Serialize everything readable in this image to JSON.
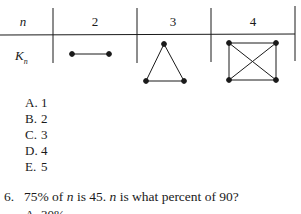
{
  "table": {
    "header_label": "n",
    "row_label": "K",
    "row_label_sub": "n",
    "columns": [
      "2",
      "3",
      "4"
    ],
    "graphs": [
      {
        "n": 2,
        "name": "K2",
        "shape": "line-segment"
      },
      {
        "n": 3,
        "name": "K3",
        "shape": "triangle"
      },
      {
        "n": 4,
        "name": "K4",
        "shape": "square-with-diagonals"
      }
    ]
  },
  "question5_options": [
    {
      "letter": "A.",
      "text": "1"
    },
    {
      "letter": "B.",
      "text": "2"
    },
    {
      "letter": "C.",
      "text": "3"
    },
    {
      "letter": "D.",
      "text": "4"
    },
    {
      "letter": "E.",
      "text": "5"
    }
  ],
  "question6": {
    "number": "6.",
    "part1": "75% of ",
    "var1": "n",
    "part2": " is 45. ",
    "var2": "n",
    "part3": " is what percent of 90?",
    "next_option_partial": "A. 30%"
  },
  "colors": {
    "ink": "#1a1a1a",
    "background": "#ffffff"
  }
}
